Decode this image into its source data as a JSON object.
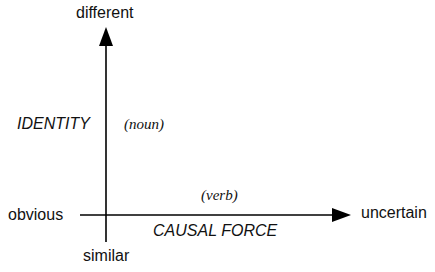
{
  "diagram": {
    "title": "",
    "axes": {
      "vertical": {
        "top_label": "different",
        "bottom_label": "similar",
        "name": "IDENTITY",
        "word_class": "(noun)"
      },
      "horizontal": {
        "left_label": "obvious",
        "right_label": "uncertain",
        "name": "CAUSAL FORCE",
        "word_class": "(verb)"
      }
    },
    "colors": {
      "axis": "#000000",
      "text": "#111111",
      "background": "#ffffff"
    }
  }
}
